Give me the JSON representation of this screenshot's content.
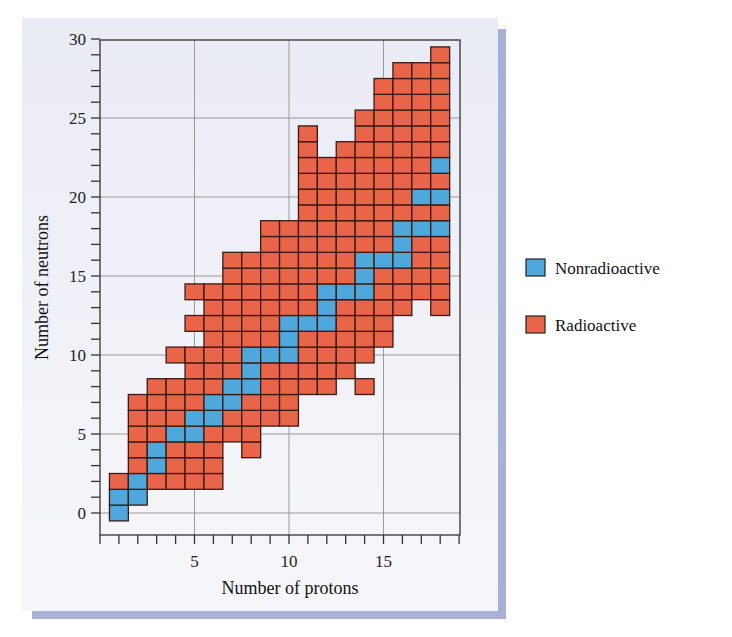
{
  "chart_data": {
    "type": "heatmap",
    "title": "",
    "xlabel": "Number of protons",
    "ylabel": "Number of neutrons",
    "xlim": [
      0,
      19
    ],
    "ylim": [
      -1.5,
      30
    ],
    "x_ticks": [
      5,
      10,
      15
    ],
    "y_ticks": [
      0,
      5,
      10,
      15,
      20,
      25,
      30
    ],
    "minor_tick_step": 1,
    "grid": true,
    "legend_position": "right",
    "colors": {
      "Nonradioactive": "#4ea8dc",
      "Radioactive": "#e8654a"
    },
    "legend": [
      {
        "label": "Nonradioactive",
        "color": "#4ea8dc"
      },
      {
        "label": "Radioactive",
        "color": "#e8654a"
      }
    ],
    "columns": [
      {
        "protons": 1,
        "neutrons": [
          0,
          1,
          2
        ],
        "stable": [
          0,
          1
        ]
      },
      {
        "protons": 2,
        "neutrons": [
          1,
          2,
          3,
          4,
          5,
          6,
          7
        ],
        "stable": [
          1,
          2
        ]
      },
      {
        "protons": 3,
        "neutrons": [
          2,
          3,
          4,
          5,
          6,
          7,
          8
        ],
        "stable": [
          3,
          4
        ]
      },
      {
        "protons": 4,
        "neutrons": [
          2,
          3,
          4,
          5,
          6,
          7,
          8,
          10
        ],
        "stable": [
          5
        ]
      },
      {
        "protons": 5,
        "neutrons": [
          2,
          3,
          4,
          5,
          6,
          7,
          8,
          9,
          10,
          12,
          14
        ],
        "stable": [
          5,
          6
        ]
      },
      {
        "protons": 6,
        "neutrons": [
          2,
          3,
          4,
          5,
          6,
          7,
          8,
          9,
          10,
          11,
          12,
          13,
          14
        ],
        "stable": [
          6,
          7
        ]
      },
      {
        "protons": 7,
        "neutrons": [
          5,
          6,
          7,
          8,
          9,
          10,
          11,
          12,
          13,
          14,
          15,
          16
        ],
        "stable": [
          7,
          8
        ]
      },
      {
        "protons": 8,
        "neutrons": [
          4,
          5,
          6,
          7,
          8,
          9,
          10,
          11,
          12,
          13,
          14,
          15,
          16
        ],
        "stable": [
          8,
          9,
          10
        ]
      },
      {
        "protons": 9,
        "neutrons": [
          6,
          7,
          8,
          9,
          10,
          11,
          12,
          13,
          14,
          15,
          16,
          17,
          18
        ],
        "stable": [
          10
        ]
      },
      {
        "protons": 10,
        "neutrons": [
          6,
          7,
          8,
          9,
          10,
          11,
          12,
          13,
          14,
          15,
          16,
          17,
          18
        ],
        "stable": [
          10,
          11,
          12
        ]
      },
      {
        "protons": 11,
        "neutrons": [
          8,
          9,
          10,
          11,
          12,
          13,
          14,
          15,
          16,
          17,
          18,
          19,
          20,
          21,
          22,
          23,
          24
        ],
        "stable": [
          12
        ]
      },
      {
        "protons": 12,
        "neutrons": [
          8,
          9,
          10,
          11,
          12,
          13,
          14,
          15,
          16,
          17,
          18,
          19,
          20,
          21,
          22
        ],
        "stable": [
          12,
          13,
          14
        ]
      },
      {
        "protons": 13,
        "neutrons": [
          9,
          10,
          11,
          12,
          13,
          14,
          15,
          16,
          17,
          18,
          19,
          20,
          21,
          22,
          23
        ],
        "stable": [
          14
        ]
      },
      {
        "protons": 14,
        "neutrons": [
          8,
          10,
          11,
          12,
          13,
          14,
          15,
          16,
          17,
          18,
          19,
          20,
          21,
          22,
          23,
          24,
          25
        ],
        "stable": [
          14,
          15,
          16
        ]
      },
      {
        "protons": 15,
        "neutrons": [
          11,
          12,
          13,
          14,
          15,
          16,
          17,
          18,
          19,
          20,
          21,
          22,
          23,
          24,
          25,
          26,
          27
        ],
        "stable": [
          16
        ]
      },
      {
        "protons": 16,
        "neutrons": [
          13,
          14,
          15,
          16,
          17,
          18,
          19,
          20,
          21,
          22,
          23,
          24,
          25,
          26,
          27,
          28
        ],
        "stable": [
          16,
          17,
          18
        ]
      },
      {
        "protons": 17,
        "neutrons": [
          14,
          15,
          16,
          17,
          18,
          19,
          20,
          21,
          22,
          23,
          24,
          25,
          26,
          27,
          28
        ],
        "stable": [
          18,
          20
        ]
      },
      {
        "protons": 18,
        "neutrons": [
          13,
          14,
          15,
          16,
          17,
          18,
          19,
          20,
          21,
          22,
          23,
          24,
          25,
          26,
          27,
          28,
          29
        ],
        "stable": [
          18,
          20,
          22
        ]
      }
    ]
  }
}
